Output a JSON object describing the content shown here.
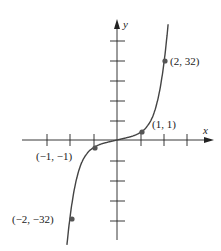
{
  "figure": {
    "function": "y = x^5",
    "axes": {
      "x_label": "x",
      "y_label": "y",
      "x_ticks": [
        -3,
        -2,
        -1,
        1,
        2,
        3
      ],
      "y_tick_count_above": 5,
      "y_tick_count_below": 4
    },
    "points": [
      {
        "label": "(2, 32)",
        "x": 2,
        "y": 32
      },
      {
        "label": "(1, 1)",
        "x": 1,
        "y": 1
      },
      {
        "label": "(−1, −1)",
        "x": -1,
        "y": -1
      },
      {
        "label": "(−2, −32)",
        "x": -2,
        "y": -32
      }
    ],
    "colors": {
      "axis": "#222222",
      "curve": "#444444",
      "point": "#555555"
    }
  }
}
